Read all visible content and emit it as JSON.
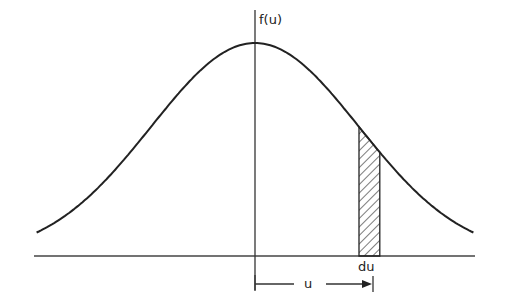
{
  "diagram": {
    "y_axis_label": "f(u)",
    "strip_label": "du",
    "distance_label": "u",
    "curve": {
      "type": "gaussian",
      "mean": 0,
      "std": 1,
      "x_range_std": [
        -2.1,
        2.1
      ]
    },
    "strip": {
      "start_std": 1.0,
      "width_std": 0.2
    },
    "colors": {
      "ink": "#222222",
      "background": "#ffffff"
    }
  }
}
